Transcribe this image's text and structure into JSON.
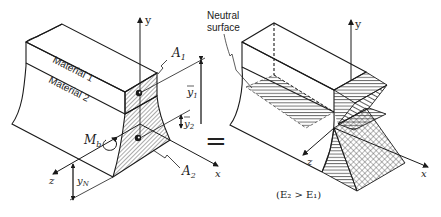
{
  "figure": {
    "left_block": {
      "material_top_label": "Material 1",
      "material_bottom_label": "Material 2",
      "area_top_label": "A",
      "area_top_sub": "1",
      "area_bottom_label": "A",
      "area_bottom_sub": "2",
      "ybar1_label": "y",
      "ybar1_sub": "1",
      "ybar2_label": "y",
      "ybar2_sub": "2",
      "moment_label": "M",
      "moment_sub": "b",
      "yN_label": "y",
      "yN_sub": "N",
      "axis_y": "y",
      "axis_x": "x",
      "axis_z": "z"
    },
    "equals_sign": "=",
    "right_block": {
      "neutral_label_line1": "Neutral",
      "neutral_label_line2": "surface",
      "axis_y": "y",
      "axis_x": "x",
      "axis_z": "z",
      "condition": "(E₂ > E₁)"
    },
    "colors": {
      "line": "#1a1a1a",
      "hatch": "#333333",
      "background": "#ffffff"
    }
  }
}
